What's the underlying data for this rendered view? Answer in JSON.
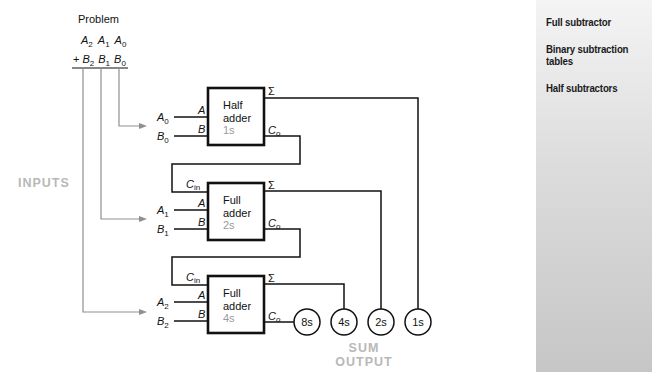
{
  "problem": {
    "title": "Problem",
    "row_a": [
      "A",
      "2",
      "A",
      "1",
      "A",
      "0"
    ],
    "row_b_prefix": "+",
    "row_b": [
      "B",
      "2",
      "B",
      "1",
      "B",
      "0"
    ]
  },
  "labels": {
    "inputs": "INPUTS",
    "sum_output_line1": "SUM",
    "sum_output_line2": "OUTPUT"
  },
  "adders": [
    {
      "type_line1": "Half",
      "type_line2": "adder",
      "weight": "1s",
      "in_a_name": "A",
      "in_a_sub": "0",
      "in_b_name": "B",
      "in_b_sub": "0",
      "pin_a": "A",
      "pin_b": "B",
      "pin_sum": "Σ",
      "pin_carry": "C",
      "pin_carry_sub": "o"
    },
    {
      "type_line1": "Full",
      "type_line2": "adder",
      "weight": "2s",
      "in_a_name": "A",
      "in_a_sub": "1",
      "in_b_name": "B",
      "in_b_sub": "1",
      "pin_cin": "C",
      "pin_cin_sub": "in",
      "pin_a": "A",
      "pin_b": "B",
      "pin_sum": "Σ",
      "pin_carry": "C",
      "pin_carry_sub": "o"
    },
    {
      "type_line1": "Full",
      "type_line2": "adder",
      "weight": "4s",
      "in_a_name": "A",
      "in_a_sub": "2",
      "in_b_name": "B",
      "in_b_sub": "2",
      "pin_cin": "C",
      "pin_cin_sub": "in",
      "pin_a": "A",
      "pin_b": "B",
      "pin_sum": "Σ",
      "pin_carry": "C",
      "pin_carry_sub": "o"
    }
  ],
  "outputs": [
    "8s",
    "4s",
    "2s",
    "1s"
  ],
  "sidebar": {
    "items": [
      {
        "label": "Full subtractor"
      },
      {
        "label_line1": "Binary subtraction",
        "label_line2": "tables"
      },
      {
        "label": "Half subtractors"
      }
    ]
  },
  "colors": {
    "wire": "#111111",
    "input_arrow": "#8f8f8f",
    "label_gray": "#b8b8b8",
    "weight_gray": "#9a9a9a"
  }
}
